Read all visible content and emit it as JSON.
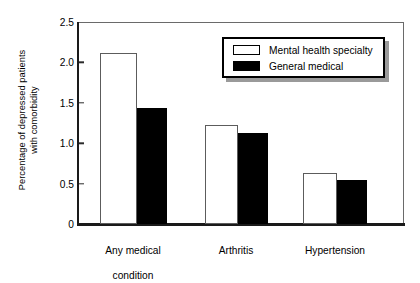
{
  "chart_data": {
    "type": "bar",
    "title": "",
    "xlabel": "",
    "ylabel": "Percentage of depressed patients\nwith comorbidity",
    "ylabel_lines": [
      "Percentage of depressed patients",
      "with comorbidity"
    ],
    "categories": [
      "Any medical\ncondition",
      "Arthritis",
      "Hypertension"
    ],
    "category_labels": [
      {
        "line1": "Any medical",
        "line2": "condition"
      },
      {
        "line1": "Arthritis",
        "line2": ""
      },
      {
        "line1": "Hypertension",
        "line2": ""
      }
    ],
    "series": [
      {
        "name": "Mental health specialty",
        "style": "open",
        "fill": "#ffffff",
        "edge": "#000000",
        "values": [
          2.12,
          1.22,
          0.63
        ]
      },
      {
        "name": "General medical",
        "style": "filled",
        "fill": "#000000",
        "edge": "#000000",
        "values": [
          1.43,
          1.13,
          0.55
        ]
      }
    ],
    "ylim": [
      0,
      2.5
    ],
    "yticks": [
      0,
      0.5,
      1.0,
      1.5,
      2.0,
      2.5
    ],
    "ytick_labels": [
      "0",
      "0.5",
      "1.0",
      "1.5",
      "2.0",
      "2.5"
    ],
    "grid": false,
    "legend_position": "upper right",
    "legend_entries": [
      "Mental health specialty",
      "General medical"
    ]
  },
  "legend": {
    "entry_0": "Mental health specialty",
    "entry_1": "General medical"
  },
  "axis": {
    "y_title_line1": "Percentage of depressed patients",
    "y_title_line2": "with comorbidity",
    "tick_0": "0",
    "tick_1": "0.5",
    "tick_2": "1.0",
    "tick_3": "1.5",
    "tick_4": "2.0",
    "tick_5": "2.5"
  },
  "xcats": {
    "cat_0_line1": "Any medical",
    "cat_0_line2": "condition",
    "cat_1_line1": "Arthritis",
    "cat_2_line1": "Hypertension"
  }
}
